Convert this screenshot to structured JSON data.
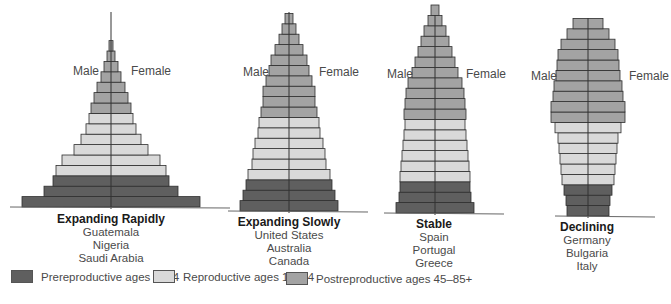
{
  "colors": {
    "prereproductive": "#5f5f5f",
    "reproductive": "#d9d9d9",
    "postreproductive": "#a3a3a3",
    "outline": "#2e2e2e",
    "axis": "#333333"
  },
  "pyramids": [
    {
      "title": "Expanding Rapidly",
      "countries": [
        "Guatemala",
        "Nigeria",
        "Saudi Arabia"
      ],
      "male_label": "Male",
      "female_label": "Female",
      "cx": 111,
      "baseline": 207,
      "row_h": 10.4,
      "spike_top": 12,
      "half_widths_bottom_up": [
        89,
        67,
        58,
        55,
        49,
        37,
        30,
        25,
        22,
        20,
        17,
        14,
        10,
        7,
        4,
        2
      ],
      "groups_bottom_up": [
        "pre",
        "pre",
        "pre",
        "rep",
        "rep",
        "rep",
        "rep",
        "rep",
        "rep",
        "post",
        "post",
        "post",
        "post",
        "post",
        "post",
        "post"
      ]
    },
    {
      "title": "Expanding Slowly",
      "countries": [
        "United States",
        "Australia",
        "Canada"
      ],
      "male_label": "Male",
      "female_label": "Female",
      "cx": 289,
      "baseline": 211,
      "row_h": 10.4,
      "spike_top": 12,
      "half_widths_bottom_up": [
        49,
        46,
        43,
        41,
        37,
        36,
        34,
        31,
        30,
        28,
        26,
        26,
        23,
        20,
        18,
        14,
        10,
        7,
        4
      ],
      "groups_bottom_up": [
        "pre",
        "pre",
        "pre",
        "rep",
        "rep",
        "rep",
        "rep",
        "rep",
        "rep",
        "post",
        "post",
        "post",
        "post",
        "post",
        "post",
        "post",
        "post",
        "post",
        "post"
      ]
    },
    {
      "title": "Stable",
      "countries": [
        "Spain",
        "Portugal",
        "Greece"
      ],
      "male_label": "Male",
      "female_label": "Female",
      "cx": 435,
      "baseline": 213,
      "row_h": 10.4,
      "spike_top": 15,
      "half_widths_bottom_up": [
        39,
        36,
        35,
        35,
        34,
        33,
        32,
        31,
        30,
        31,
        30,
        29,
        27,
        23,
        20,
        17,
        14,
        11,
        7,
        4
      ],
      "groups_bottom_up": [
        "pre",
        "pre",
        "pre",
        "rep",
        "rep",
        "rep",
        "rep",
        "rep",
        "rep",
        "post",
        "post",
        "post",
        "post",
        "post",
        "post",
        "post",
        "post",
        "post",
        "post",
        "post"
      ]
    },
    {
      "title": "Declining",
      "countries": [
        "Germany",
        "Bulgaria",
        "Italy"
      ],
      "male_label": "Male",
      "female_label": "Female",
      "cx": 588,
      "baseline": 216,
      "row_h": 10.4,
      "spike_top": 18,
      "half_widths_bottom_up": [
        21,
        22,
        24,
        26,
        27,
        28,
        29,
        30,
        33,
        37,
        37,
        35,
        34,
        32,
        31,
        30,
        27,
        21,
        15
      ],
      "groups_bottom_up": [
        "pre",
        "pre",
        "pre",
        "rep",
        "rep",
        "rep",
        "rep",
        "rep",
        "rep",
        "post",
        "post",
        "post",
        "post",
        "post",
        "post",
        "post",
        "post",
        "post",
        "post"
      ]
    }
  ],
  "legend": [
    {
      "key": "prereproductive",
      "label": "Prereproductive ages 0–14"
    },
    {
      "key": "reproductive",
      "label": "Reproductive ages 15–44"
    },
    {
      "key": "postreproductive",
      "label": "Postreproductive ages 45–85+"
    }
  ]
}
